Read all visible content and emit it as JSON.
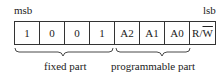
{
  "labels": {
    "msb": "msb",
    "lsb": "lsb"
  },
  "bits": [
    {
      "label": "1"
    },
    {
      "label": "0"
    },
    {
      "label": "0"
    },
    {
      "label": "1"
    },
    {
      "label": "A2"
    },
    {
      "label": "A1"
    },
    {
      "label": "A0"
    },
    {
      "label_prefix": "R/",
      "label_overline": "W"
    }
  ],
  "groups": {
    "fixed": "fixed part",
    "programmable": "programmable part"
  }
}
